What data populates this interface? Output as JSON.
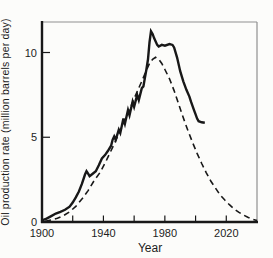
{
  "figure": {
    "background": "#fcfcfa",
    "ink_color": "#181818",
    "frame_color": "#8f8f8f"
  },
  "chart_data": {
    "type": "line",
    "title": "",
    "xlabel": "Year",
    "ylabel": "Oil production rate (million barrels per day)",
    "xlim": [
      1900,
      2040
    ],
    "ylim": [
      0,
      11.8
    ],
    "x_major_ticks": [
      1900,
      1940,
      1980,
      2020
    ],
    "x_minor_ticks": [
      1920,
      1960,
      2000
    ],
    "y_ticks": [
      0,
      5,
      10
    ],
    "grid": false,
    "legend_position": "none",
    "series": [
      {
        "name": "actual-production",
        "label": "Actual oil production (solid)",
        "style": "solid",
        "color": "#181818",
        "width": 2.4,
        "points": [
          [
            1900,
            0.1
          ],
          [
            1903,
            0.2
          ],
          [
            1906,
            0.35
          ],
          [
            1909,
            0.5
          ],
          [
            1912,
            0.6
          ],
          [
            1915,
            0.72
          ],
          [
            1918,
            0.9
          ],
          [
            1920,
            1.15
          ],
          [
            1922,
            1.45
          ],
          [
            1924,
            1.8
          ],
          [
            1926,
            2.25
          ],
          [
            1928,
            2.8
          ],
          [
            1929,
            3.0
          ],
          [
            1930,
            2.85
          ],
          [
            1931,
            2.7
          ],
          [
            1933,
            2.85
          ],
          [
            1935,
            3.0
          ],
          [
            1937,
            3.35
          ],
          [
            1939,
            3.75
          ],
          [
            1941,
            3.95
          ],
          [
            1943,
            4.2
          ],
          [
            1945,
            4.5
          ],
          [
            1946,
            4.85
          ],
          [
            1947,
            5.05
          ],
          [
            1948,
            4.85
          ],
          [
            1950,
            5.45
          ],
          [
            1951,
            5.25
          ],
          [
            1953,
            6.1
          ],
          [
            1954,
            5.8
          ],
          [
            1956,
            6.6
          ],
          [
            1957,
            6.3
          ],
          [
            1959,
            7.1
          ],
          [
            1960,
            6.8
          ],
          [
            1962,
            7.5
          ],
          [
            1963,
            7.2
          ],
          [
            1965,
            7.9
          ],
          [
            1966,
            8.0
          ],
          [
            1967,
            8.5
          ],
          [
            1968,
            9.0
          ],
          [
            1969,
            9.6
          ],
          [
            1970,
            10.6
          ],
          [
            1971,
            11.25
          ],
          [
            1972,
            11.1
          ],
          [
            1973,
            10.85
          ],
          [
            1975,
            10.45
          ],
          [
            1976,
            10.35
          ],
          [
            1978,
            10.45
          ],
          [
            1980,
            10.4
          ],
          [
            1983,
            10.5
          ],
          [
            1985,
            10.45
          ],
          [
            1986,
            10.3
          ],
          [
            1988,
            9.7
          ],
          [
            1990,
            8.9
          ],
          [
            1992,
            8.3
          ],
          [
            1994,
            7.8
          ],
          [
            1996,
            7.4
          ],
          [
            1997,
            7.1
          ],
          [
            1998,
            6.85
          ],
          [
            1999,
            6.6
          ],
          [
            2000,
            6.35
          ],
          [
            2001,
            6.1
          ],
          [
            2002,
            5.95
          ],
          [
            2004,
            5.88
          ],
          [
            2006,
            5.85
          ]
        ]
      },
      {
        "name": "hubbert-curve",
        "label": "Predicted bell curve (dashed)",
        "style": "dashed",
        "color": "#181818",
        "width": 1.6,
        "points": [
          [
            1902,
            0.05
          ],
          [
            1906,
            0.12
          ],
          [
            1910,
            0.22
          ],
          [
            1914,
            0.38
          ],
          [
            1918,
            0.6
          ],
          [
            1922,
            0.92
          ],
          [
            1926,
            1.35
          ],
          [
            1930,
            1.85
          ],
          [
            1934,
            2.45
          ],
          [
            1938,
            2.95
          ],
          [
            1942,
            3.65
          ],
          [
            1946,
            4.4
          ],
          [
            1950,
            5.2
          ],
          [
            1954,
            6.0
          ],
          [
            1958,
            6.85
          ],
          [
            1962,
            7.7
          ],
          [
            1965,
            8.3
          ],
          [
            1968,
            8.95
          ],
          [
            1970,
            9.35
          ],
          [
            1972,
            9.6
          ],
          [
            1974,
            9.72
          ],
          [
            1976,
            9.6
          ],
          [
            1978,
            9.35
          ],
          [
            1980,
            9.0
          ],
          [
            1983,
            8.45
          ],
          [
            1986,
            7.75
          ],
          [
            1989,
            6.95
          ],
          [
            1992,
            6.15
          ],
          [
            1995,
            5.4
          ],
          [
            1998,
            4.7
          ],
          [
            2001,
            4.05
          ],
          [
            2004,
            3.45
          ],
          [
            2007,
            2.9
          ],
          [
            2010,
            2.4
          ],
          [
            2013,
            2.0
          ],
          [
            2016,
            1.6
          ],
          [
            2019,
            1.3
          ],
          [
            2022,
            1.02
          ],
          [
            2025,
            0.78
          ],
          [
            2028,
            0.58
          ],
          [
            2031,
            0.42
          ],
          [
            2034,
            0.28
          ],
          [
            2037,
            0.17
          ],
          [
            2040,
            0.08
          ]
        ]
      }
    ]
  }
}
